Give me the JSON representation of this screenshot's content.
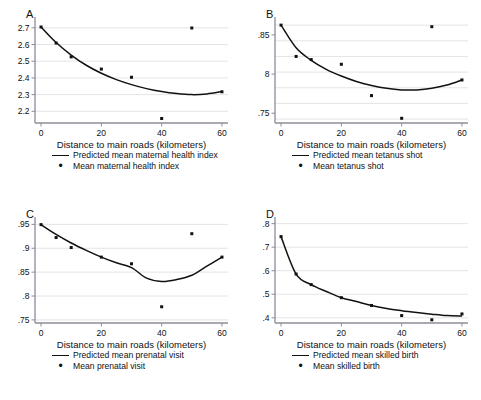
{
  "figure": {
    "title": "",
    "panels": [
      "A",
      "B",
      "C",
      "D"
    ]
  },
  "chart_data": [
    {
      "panel": "A",
      "type": "scatter",
      "title": "A",
      "xlabel": "Distance to main roads (kilometers)",
      "ylabel": "",
      "xlim": [
        -2,
        62
      ],
      "ylim": [
        2.13,
        2.735
      ],
      "xticks": [
        0,
        20,
        40,
        60
      ],
      "xtick_labels": [
        "0",
        "20",
        "40",
        "60"
      ],
      "yticks": [
        2.2,
        2.3,
        2.4,
        2.5,
        2.6,
        2.7
      ],
      "ytick_labels": [
        "2.2",
        "2.3",
        "2.4",
        "2.5",
        "2.6",
        "2.7"
      ],
      "grid": true,
      "legend_position": "below",
      "series": [
        {
          "name": "Predicted mean maternal health index",
          "kind": "line",
          "x": [
            0,
            5,
            10,
            15,
            20,
            25,
            30,
            35,
            40,
            45,
            50,
            55,
            60
          ],
          "values": [
            2.705,
            2.612,
            2.537,
            2.476,
            2.428,
            2.39,
            2.36,
            2.336,
            2.318,
            2.306,
            2.3,
            2.304,
            2.318
          ]
        },
        {
          "name": "Mean maternal health index",
          "kind": "points",
          "x": [
            0,
            5,
            10,
            20,
            30,
            40,
            50,
            60
          ],
          "values": [
            2.705,
            2.609,
            2.526,
            2.453,
            2.404,
            2.157,
            2.699,
            2.317
          ]
        }
      ]
    },
    {
      "panel": "B",
      "type": "scatter",
      "title": "B",
      "xlabel": "Distance to main roads (kilometers)",
      "ylabel": "",
      "xlim": [
        -2,
        62
      ],
      "ylim": [
        0.7375,
        0.8665
      ],
      "xticks": [
        0,
        20,
        40,
        60
      ],
      "xtick_labels": [
        "0",
        "20",
        "40",
        "60"
      ],
      "yticks": [
        0.75,
        0.8,
        0.85
      ],
      "ytick_labels": [
        ".75",
        "8",
        ".85"
      ],
      "gridlines": [
        0.7425,
        0.7625,
        0.7825,
        0.8025,
        0.8225,
        0.8425,
        0.8625
      ],
      "grid": true,
      "legend_position": "below",
      "series": [
        {
          "name": "Predicted mean tetanus shot",
          "kind": "line",
          "x": [
            0,
            5,
            10,
            15,
            20,
            25,
            30,
            35,
            40,
            45,
            50,
            55,
            60
          ],
          "values": [
            0.8625,
            0.8335,
            0.8175,
            0.806,
            0.7975,
            0.7905,
            0.7855,
            0.7818,
            0.7798,
            0.7798,
            0.7818,
            0.786,
            0.7925
          ]
        },
        {
          "name": "Mean tetanus shot",
          "kind": "points",
          "x": [
            0,
            5,
            10,
            20,
            30,
            40,
            50,
            60
          ],
          "values": [
            0.8625,
            0.8225,
            0.8185,
            0.8125,
            0.7725,
            0.7435,
            0.8605,
            0.7925
          ]
        }
      ]
    },
    {
      "panel": "C",
      "type": "scatter",
      "title": "C",
      "xlabel": "Distance to main roads (kilometers)",
      "ylabel": "",
      "xlim": [
        -2,
        62
      ],
      "ylim": [
        0.7435,
        0.955
      ],
      "xticks": [
        0,
        20,
        40,
        60
      ],
      "xtick_labels": [
        "0",
        "20",
        "40",
        "60"
      ],
      "yticks": [
        0.75,
        0.8,
        0.85,
        0.9,
        0.95
      ],
      "ytick_labels": [
        ".75",
        ".8",
        ".85",
        ".9",
        ".95"
      ],
      "grid": true,
      "legend_position": "below",
      "series": [
        {
          "name": "Predicted mean prenatal visit",
          "kind": "line",
          "x": [
            0,
            5,
            10,
            15,
            20,
            25,
            30,
            35,
            40,
            45,
            50,
            55,
            60
          ],
          "values": [
            0.9495,
            0.929,
            0.911,
            0.8955,
            0.8815,
            0.8695,
            0.8595,
            0.8375,
            0.8305,
            0.8345,
            0.8435,
            0.8625,
            0.8815
          ]
        },
        {
          "name": "Mean prenatal visit",
          "kind": "points",
          "x": [
            0,
            5,
            10,
            20,
            30,
            40,
            50,
            60
          ],
          "values": [
            0.9495,
            0.9225,
            0.9015,
            0.8815,
            0.8675,
            0.7775,
            0.9305,
            0.8815
          ]
        }
      ]
    },
    {
      "panel": "D",
      "type": "scatter",
      "title": "D",
      "xlabel": "Distance to main roads (kilometers)",
      "ylabel": "",
      "xlim": [
        -2,
        62
      ],
      "ylim": [
        0.378,
        0.807
      ],
      "xticks": [
        0,
        20,
        40,
        60
      ],
      "xtick_labels": [
        "0",
        "20",
        "40",
        "60"
      ],
      "yticks": [
        0.4,
        0.5,
        0.6,
        0.7,
        0.8
      ],
      "ytick_labels": [
        ".4",
        ".5",
        ".6",
        ".7",
        ".8"
      ],
      "grid": true,
      "legend_position": "below",
      "series": [
        {
          "name": "Predicted mean skilled birth",
          "kind": "line",
          "x": [
            0,
            5,
            10,
            15,
            20,
            25,
            30,
            35,
            40,
            45,
            50,
            55,
            60
          ],
          "values": [
            0.745,
            0.586,
            0.541,
            0.512,
            0.4855,
            0.469,
            0.4525,
            0.44,
            0.4305,
            0.4225,
            0.4155,
            0.4095,
            0.4075
          ]
        },
        {
          "name": "Mean skilled birth",
          "kind": "points",
          "x": [
            0,
            5,
            10,
            20,
            30,
            40,
            50,
            60
          ],
          "values": [
            0.745,
            0.586,
            0.541,
            0.4855,
            0.4525,
            0.4095,
            0.3915,
            0.4165
          ]
        }
      ]
    }
  ]
}
